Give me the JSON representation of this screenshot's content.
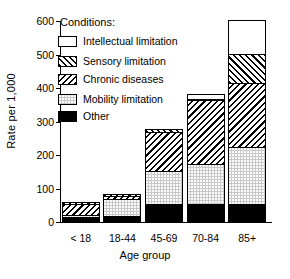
{
  "chart_data": {
    "type": "bar",
    "title": "",
    "subtitle": "",
    "xlabel": "Age group",
    "ylabel": "Rate per 1,000",
    "categories": [
      "< 18",
      "18-44",
      "45-69",
      "70-84",
      "85+"
    ],
    "ylim": [
      0,
      600
    ],
    "yticks": [
      0,
      100,
      200,
      300,
      400,
      500,
      600
    ],
    "grid": false,
    "stacked": true,
    "legend_title": "Conditions:",
    "legend_position": "inside-top-left",
    "series": [
      {
        "name": "Other",
        "fill": "solid-black",
        "values": [
          12,
          15,
          50,
          52,
          52
        ]
      },
      {
        "name": "Mobility limitation",
        "fill": "gray-stipple",
        "values": [
          6,
          50,
          100,
          118,
          168
        ]
      },
      {
        "name": "Chronic diseases",
        "fill": "hatch-back",
        "values": [
          32,
          10,
          115,
          192,
          192
        ]
      },
      {
        "name": "Sensory limitation",
        "fill": "hatch-forward",
        "values": [
          7,
          5,
          10,
          3,
          88
        ]
      },
      {
        "name": "Intellectual limitation",
        "fill": "white",
        "values": [
          0,
          0,
          0,
          13,
          100
        ]
      }
    ],
    "totals": [
      57,
      80,
      275,
      378,
      600
    ]
  },
  "legend": {
    "title": "Conditions:",
    "entries": [
      {
        "label": "Intellectual limitation",
        "swatch": "white"
      },
      {
        "label": "Sensory limitation",
        "swatch": "hatch-forward"
      },
      {
        "label": "Chronic diseases",
        "swatch": "hatch-back"
      },
      {
        "label": "Mobility limitation",
        "swatch": "gray-stipple"
      },
      {
        "label": "Other",
        "swatch": "solid-black"
      }
    ]
  },
  "axes": {
    "y_title": "Rate per 1,000",
    "x_title": "Age group",
    "y_tick_labels": [
      "600",
      "500",
      "400",
      "300",
      "200",
      "100",
      "0"
    ],
    "x_tick_labels": [
      "< 18",
      "18-44",
      "45-69",
      "70-84",
      "85+"
    ]
  },
  "colors": {
    "axis": "#000000",
    "other": "#000000",
    "mobility": "#c9c9c9",
    "hatch": "#000000",
    "background": "#ffffff"
  }
}
